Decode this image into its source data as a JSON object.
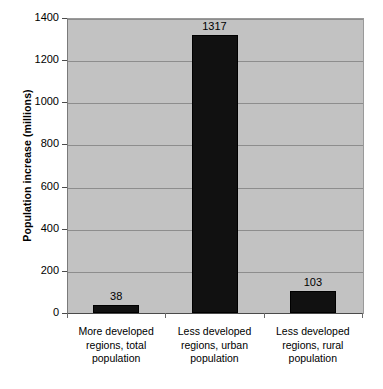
{
  "chart_data": {
    "type": "bar",
    "title": "",
    "xlabel": "",
    "ylabel": "Population increase (millions)",
    "ylim": [
      0,
      1400
    ],
    "ytick_step": 200,
    "yticks": [
      "1400",
      "1200",
      "1000",
      "800",
      "600",
      "400",
      "200",
      "0"
    ],
    "grid": true,
    "legend": "none",
    "categories": [
      "More developed regions, total population",
      "Less developed regions, urban population",
      "Less developed regions, rural population"
    ],
    "category_lines": [
      [
        "More developed",
        "regions, total",
        "population"
      ],
      [
        "Less developed",
        "regions, urban",
        "population"
      ],
      [
        "Less developed",
        "regions, rural",
        "population"
      ]
    ],
    "values": [
      38,
      1317,
      103
    ],
    "value_labels": [
      "38",
      "1317",
      "103"
    ],
    "colors": {
      "bar": "#111111",
      "plot_background": "#c2c2c2",
      "figure_background": "#ffffff",
      "gridline": "#8d8d8d",
      "axis": "#4a4a4a",
      "text": "#000000"
    }
  }
}
